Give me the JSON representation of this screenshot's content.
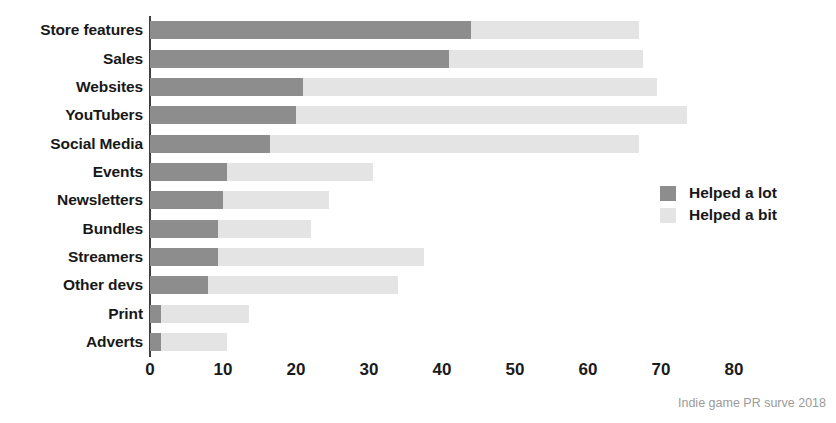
{
  "chart_data": {
    "type": "bar",
    "orientation": "horizontal",
    "stacked": true,
    "title": "",
    "xlabel": "",
    "ylabel": "",
    "xlim": [
      0,
      80
    ],
    "xticks": [
      "0",
      "10",
      "20",
      "30",
      "40",
      "50",
      "60",
      "70",
      "80"
    ],
    "grid": false,
    "legend_position": "right",
    "categories": [
      "Store features",
      "Sales",
      "Websites",
      "YouTubers",
      "Social Media",
      "Events",
      "Newsletters",
      "Bundles",
      "Streamers",
      "Other devs",
      "Print",
      "Adverts"
    ],
    "series": [
      {
        "name": "Helped a lot",
        "color": "#8d8d8d",
        "values": [
          44,
          41,
          21,
          20,
          16.5,
          10.5,
          10,
          9.3,
          9.3,
          8,
          1.5,
          1.5
        ]
      },
      {
        "name": "Helped a bit",
        "color": "#e4e4e4",
        "values": [
          23,
          26.5,
          48.5,
          53.5,
          50.5,
          20,
          14.5,
          12.7,
          28.2,
          26,
          12,
          9
        ]
      }
    ],
    "totals": [
      67,
      67.5,
      69.5,
      73.5,
      67,
      30.5,
      24.5,
      22,
      37.5,
      34,
      13.5,
      10.5
    ],
    "annotations": [
      "Indie game PR surve 2018"
    ]
  },
  "legend": {
    "items": [
      {
        "label": "Helped a lot",
        "swatch": "lot"
      },
      {
        "label": "Helped a bit",
        "swatch": "bit"
      }
    ]
  },
  "caption": "Indie game PR surve 2018",
  "colors": {
    "helped_a_lot": "#8d8d8d",
    "helped_a_bit": "#e4e4e4",
    "axis": "#3f3f3f",
    "text": "#181818",
    "caption": "#9a9a9a",
    "background": "#ffffff"
  }
}
